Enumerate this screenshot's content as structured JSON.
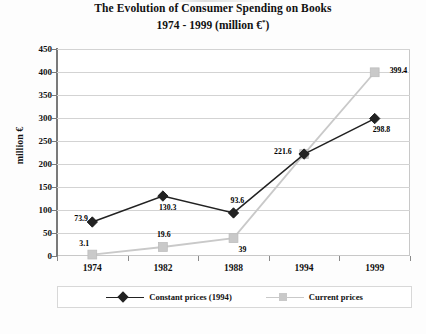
{
  "chart_data": {
    "type": "line",
    "title": "The Evolution of Consumer Spending on Books",
    "subtitle": "1974 - 1999 (million €*)",
    "subtitle_main": "1974 - 1999 (million €",
    "subtitle_sup": "*",
    "subtitle_close": ")",
    "xlabel": "",
    "ylabel": "million €",
    "categories": [
      "1974",
      "1982",
      "1988",
      "1994",
      "1999"
    ],
    "ylim": [
      0,
      450
    ],
    "ytick_step": 50,
    "yticks": [
      "450",
      "400",
      "350",
      "300",
      "250",
      "200",
      "150",
      "100",
      "50",
      "0"
    ],
    "grid": true,
    "legend_position": "bottom",
    "series": [
      {
        "name": "Constant prices (1994)",
        "marker": "diamond",
        "color": "#222222",
        "values": [
          73.9,
          130.3,
          93.6,
          221.6,
          298.8
        ],
        "labels": [
          "73.9",
          "130.3",
          "93.6",
          "",
          "298.8"
        ]
      },
      {
        "name": "Current prices",
        "marker": "square",
        "color": "#c9c9c9",
        "values": [
          3.1,
          19.6,
          39,
          221.6,
          399.4
        ],
        "labels": [
          "3.1",
          "19.6",
          "39",
          "221.6",
          "399.4"
        ]
      }
    ]
  },
  "legend": {
    "items": [
      {
        "label": "Constant prices (1994)"
      },
      {
        "label": "Current prices"
      }
    ]
  }
}
